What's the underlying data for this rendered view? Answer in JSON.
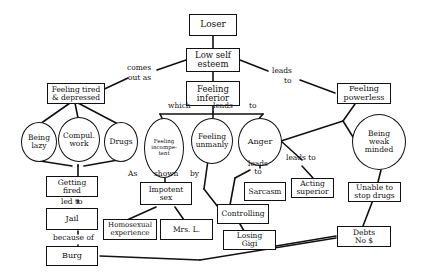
{
  "diagram": {
    "nodes": {
      "loser": "Loser",
      "low_self_esteem": "Low self\nesteem",
      "feeling_tired": "Feeling tired\n& depressed",
      "feeling_inferior": "Feeling\ninferior",
      "feeling_powerless": "Feeling\npowerless",
      "being_lazy": "Being\nlazy",
      "compul_work": "Compul.\nwork",
      "drugs": "Drugs",
      "feeling_incompetent": "Feeling\nincompe-\ntent",
      "feeling_unmanly": "Feeling\nunmanly",
      "anger": "Anger",
      "being_weak_minded": "Being\nweak\nminded",
      "getting_fired": "Getting\nfired",
      "jail": "Jail",
      "burg": "Burg",
      "impotent_sex": "Impotent\nsex",
      "homosexual_experience": "Homosexual\nexperience",
      "mrs_l": "Mrs. L.",
      "sarcasm": "Sarcasm",
      "controlling": "Controlling",
      "losing_gigi": "Losing\nGigi",
      "acting_superior": "Acting\nsuperior",
      "unable_to_stop_drugs": "Unable to\nstop drugs",
      "debts": "Debts\nNo $"
    },
    "labels": {
      "comes": "comes",
      "out_as": "out as",
      "leads_right": "leads",
      "to_right": "to",
      "which": "which",
      "leads_mid": "leads",
      "to_mid": "to",
      "as": "As",
      "shown": "shown",
      "by": "by",
      "leads_anger": "leads\nto",
      "leads_to_acting": "leads to",
      "led_to": "led to",
      "because_of": "because of"
    },
    "colors": {
      "ink": "#111111",
      "background": "#ffffff"
    }
  }
}
